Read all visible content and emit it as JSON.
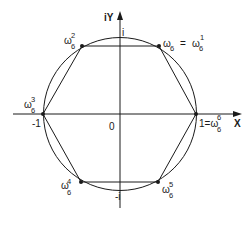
{
  "figure": {
    "axes": {
      "x_label": "X",
      "y_label": "iY",
      "origin_label": "0",
      "tick_labels": {
        "neg_one": "-1",
        "pos_i": "i",
        "neg_i": "-i"
      }
    },
    "points": [
      {
        "id": "w6_0",
        "base": "1=ω",
        "sub": "6",
        "sup": "6",
        "angle_deg": 0
      },
      {
        "id": "w6_1",
        "base": "ω",
        "sub": "6",
        "eq": "=",
        "base2": "ω",
        "sub2": "6",
        "sup2": "1",
        "angle_deg": 60
      },
      {
        "id": "w6_2",
        "base": "ω",
        "sub": "6",
        "sup": "2",
        "angle_deg": 120
      },
      {
        "id": "w6_3",
        "base": "ω",
        "sub": "6",
        "sup": "3",
        "angle_deg": 180
      },
      {
        "id": "w6_4",
        "base": "ω",
        "sub": "6",
        "sup": "4",
        "angle_deg": 240
      },
      {
        "id": "w6_5",
        "base": "ω",
        "sub": "6",
        "sup": "5",
        "angle_deg": 300
      }
    ],
    "colors": {
      "stroke": "#1a1a1a",
      "background": "#ffffff"
    }
  }
}
